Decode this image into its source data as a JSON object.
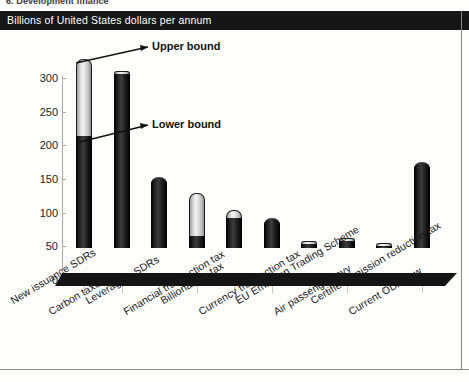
{
  "document": {
    "top_fragment": "6. Development finance",
    "banner_title": "Billions of United States dollars per annum"
  },
  "annotations": {
    "upper": "Upper bound",
    "lower": "Lower bound"
  },
  "chart_data": {
    "type": "bar",
    "title": "Billions of United States dollars per annum",
    "xlabel": "",
    "ylabel": "Billions of United States dollars per annum",
    "ylim": [
      0,
      300
    ],
    "yticks": [
      0,
      50,
      100,
      150,
      200,
      250,
      300
    ],
    "ytick_labels": [
      "0",
      "50",
      "100",
      "150",
      "200",
      "250",
      "300"
    ],
    "grid": false,
    "legend": "none",
    "stacked": true,
    "categories": [
      "New issuance SDRs",
      "Carbon taxes",
      "Leveraging SDRs",
      "Financial transaction tax",
      "Billionaire's tax",
      "Currency transaction tax",
      "EU Emission Trading Scheme",
      "Air passenger levy",
      "Certified emission reduction tax",
      "Current ODA flow"
    ],
    "series": [
      {
        "name": "Lower bound",
        "color": "#1d1d1d",
        "values": [
          166,
          258,
          105,
          18,
          45,
          45,
          6,
          11,
          2,
          128
        ]
      },
      {
        "name": "Upper bound",
        "color": "#dcdcdc",
        "values": [
          280,
          263,
          105,
          82,
          57,
          45,
          8,
          14,
          3,
          128
        ]
      }
    ],
    "annotations": [
      {
        "text": "Upper bound",
        "points_to": "New issuance SDRs upper segment top"
      },
      {
        "text": "Lower bound",
        "points_to": "New issuance SDRs lower segment top"
      }
    ]
  }
}
